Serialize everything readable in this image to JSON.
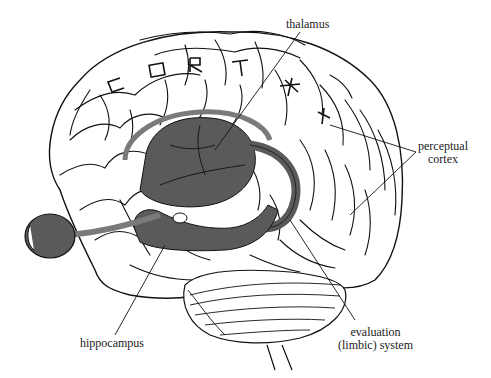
{
  "figure": {
    "colors": {
      "outline": "#111111",
      "limbic_fill": "#5a5a5a",
      "pathway_band": "#7a7a7a",
      "background": "#ffffff"
    },
    "cortex_lettering": [
      "C",
      "O",
      "R",
      "T",
      "E",
      "X"
    ],
    "labels": {
      "thalamus": "thalamus",
      "perceptual_cortex_line1": "perceptual",
      "perceptual_cortex_line2": "cortex",
      "hippocampus": "hippocampus",
      "evaluation_line1": "evaluation",
      "evaluation_line2": "(limbic) system"
    }
  }
}
